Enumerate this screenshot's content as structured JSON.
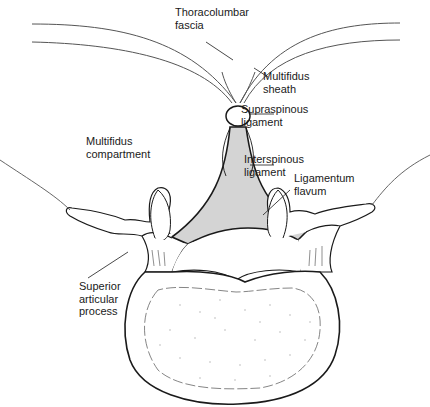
{
  "diagram": {
    "type": "anatomical-cross-section",
    "colors": {
      "line": "#1a1a1a",
      "fascia_line": "#555555",
      "ligament_fill": "#d4d4d4",
      "background": "#ffffff"
    },
    "labels": {
      "thoracolumbar_fascia": {
        "line1": "Thoracolumbar",
        "line2": "fascia"
      },
      "multifidus_sheath": {
        "line1": "Multifidus",
        "line2": "sheath"
      },
      "supraspinous_ligament": {
        "line1": "Supraspinous",
        "line2": "ligament"
      },
      "multifidus_compartment": {
        "line1": "Multifidus",
        "line2": "compartment"
      },
      "interspinous_ligament": {
        "line1": "Interspinous",
        "line2": "ligament"
      },
      "ligamentum_flavum": {
        "line1": "Ligamentum",
        "line2": "flavum"
      },
      "superior_articular_process": {
        "line1": "Superior",
        "line2": "articular",
        "line3": "process"
      }
    }
  }
}
